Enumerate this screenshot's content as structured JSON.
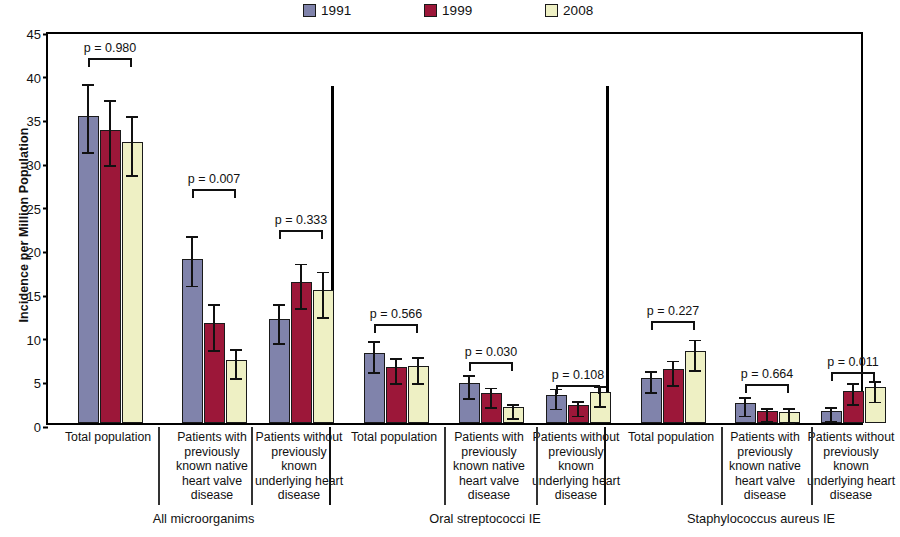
{
  "chart_data": {
    "type": "bar",
    "title": "",
    "xlabel": "",
    "ylabel": "Incidence per Million Population",
    "ylim": [
      0,
      45
    ],
    "yticks": [
      0,
      5,
      10,
      15,
      20,
      25,
      30,
      35,
      40,
      45
    ],
    "grid": false,
    "legend_position": "top-center",
    "series": [
      {
        "name": "1991",
        "color": "#8083ab"
      },
      {
        "name": "1999",
        "color": "#9c1739"
      },
      {
        "name": "2008",
        "color": "#eef0c4"
      }
    ],
    "groups": [
      {
        "name": "All microorganims",
        "subgroups": [
          {
            "label": "Total population",
            "p_value": "p = 0.980",
            "values": [
              35.2,
              33.5,
              32.2
            ],
            "err_low": [
              31.5,
              30.0,
              28.8
            ],
            "err_high": [
              39.3,
              37.4,
              35.6
            ]
          },
          {
            "label": "Patients with previously known native heart valve disease",
            "p_value": "p = 0.007",
            "values": [
              18.8,
              11.4,
              7.2
            ],
            "err_low": [
              16.2,
              8.8,
              5.6
            ],
            "err_high": [
              21.9,
              14.1,
              8.9
            ]
          },
          {
            "label": "Patients without previously known underlying heart disease",
            "p_value": "p = 0.333",
            "values": [
              11.9,
              16.2,
              15.2
            ],
            "err_low": [
              9.6,
              13.6,
              12.6
            ],
            "err_high": [
              14.1,
              18.7,
              17.8
            ]
          }
        ]
      },
      {
        "name": "Oral streptococci IE",
        "subgroups": [
          {
            "label": "Total population",
            "p_value": "p = 0.566",
            "values": [
              8.0,
              6.4,
              6.5
            ],
            "err_low": [
              6.3,
              5.0,
              5.0
            ],
            "err_high": [
              9.8,
              7.9,
              8.0
            ]
          },
          {
            "label": "Patients with previously known native heart valve disease",
            "p_value": "p = 0.030",
            "values": [
              4.6,
              3.4,
              1.8
            ],
            "err_low": [
              3.3,
              2.3,
              1.0
            ],
            "err_high": [
              5.9,
              4.5,
              2.6
            ]
          },
          {
            "label": "Patients without previously known underlying heart disease",
            "p_value": "p = 0.108",
            "values": [
              3.2,
              2.1,
              3.5
            ],
            "err_low": [
              2.1,
              1.3,
              2.4
            ],
            "err_high": [
              4.4,
              3.0,
              4.7
            ]
          }
        ]
      },
      {
        "name": "Staphylococcus aureus IE",
        "subgroups": [
          {
            "label": "Total population",
            "p_value": "p = 0.227",
            "values": [
              5.2,
              6.2,
              8.2
            ],
            "err_low": [
              4.0,
              4.8,
              6.5
            ],
            "err_high": [
              6.4,
              7.6,
              10.0
            ]
          },
          {
            "label": "Patients with previously known native heart valve disease",
            "p_value": "p = 0.664",
            "values": [
              2.3,
              1.4,
              1.3
            ],
            "err_low": [
              1.3,
              0.7,
              0.6
            ],
            "err_high": [
              3.4,
              2.2,
              2.2
            ]
          },
          {
            "label": "Patients without previously known underlying heart disease",
            "p_value": "p = 0.011",
            "values": [
              1.4,
              3.7,
              4.1
            ],
            "err_low": [
              0.7,
              2.6,
              2.9
            ],
            "err_high": [
              2.3,
              5.0,
              5.3
            ]
          }
        ]
      }
    ]
  },
  "legend": {
    "items": [
      {
        "label": "1991",
        "color": "#8083ab"
      },
      {
        "label": "1999",
        "color": "#9c1739"
      },
      {
        "label": "2008",
        "color": "#eef0c4"
      }
    ]
  },
  "axis": {
    "y_title": "Incidence per Million Population"
  },
  "subgroup_lines": {
    "total": [
      "Total population"
    ],
    "with": [
      "Patients with",
      "previously",
      "known native",
      "heart valve",
      "disease"
    ],
    "without": [
      "Patients without",
      "previously",
      "known",
      "underlying heart",
      "disease"
    ]
  }
}
